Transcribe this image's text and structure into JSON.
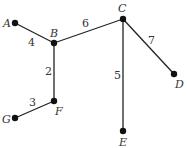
{
  "diagram": {
    "type": "weighted-tree",
    "nodes": [
      {
        "id": "A",
        "label": "A",
        "x": 15,
        "y": 23,
        "lx": 3,
        "ly": 27
      },
      {
        "id": "B",
        "label": "B",
        "x": 54,
        "y": 43,
        "lx": 50,
        "ly": 37
      },
      {
        "id": "C",
        "label": "C",
        "x": 123,
        "y": 19,
        "lx": 118,
        "ly": 12
      },
      {
        "id": "D",
        "label": "D",
        "x": 174,
        "y": 74,
        "lx": 175,
        "ly": 88
      },
      {
        "id": "E",
        "label": "E",
        "x": 123,
        "y": 131,
        "lx": 119,
        "ly": 146
      },
      {
        "id": "F",
        "label": "F",
        "x": 54,
        "y": 101,
        "lx": 55,
        "ly": 115
      },
      {
        "id": "G",
        "label": "G",
        "x": 15,
        "y": 118,
        "lx": 2,
        "ly": 123
      }
    ],
    "edges": [
      {
        "from": "A",
        "to": "B",
        "weight": "4",
        "wx": 28,
        "wy": 46
      },
      {
        "from": "B",
        "to": "C",
        "weight": "6",
        "wx": 82,
        "wy": 27
      },
      {
        "from": "B",
        "to": "F",
        "weight": "2",
        "wx": 45,
        "wy": 75
      },
      {
        "from": "F",
        "to": "G",
        "weight": "3",
        "wx": 29,
        "wy": 106
      },
      {
        "from": "C",
        "to": "D",
        "weight": "7",
        "wx": 148,
        "wy": 44
      },
      {
        "from": "C",
        "to": "E",
        "weight": "5",
        "wx": 114,
        "wy": 79
      }
    ]
  }
}
